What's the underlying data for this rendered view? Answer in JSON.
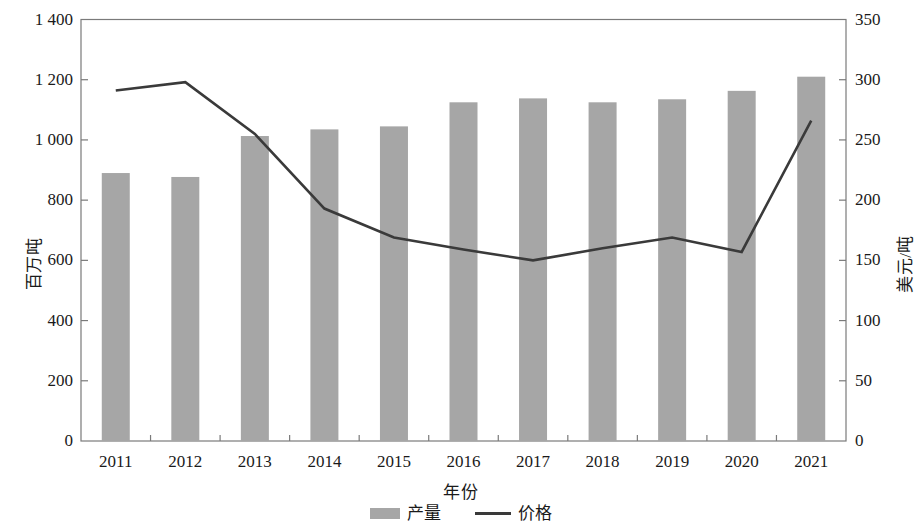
{
  "chart_data": {
    "type": "bar",
    "title": "",
    "xlabel": "年份",
    "ylabel": "百万吨",
    "ylabel_right": "美元/吨",
    "categories": [
      "2011",
      "2012",
      "2013",
      "2014",
      "2015",
      "2016",
      "2017",
      "2018",
      "2019",
      "2020",
      "2021"
    ],
    "ylim": [
      0,
      1400
    ],
    "ylim_right": [
      0,
      350
    ],
    "yticks": [
      "0",
      "200",
      "400",
      "600",
      "800",
      "1 000",
      "1 200",
      "1 400"
    ],
    "ytick_values": [
      0,
      200,
      400,
      600,
      800,
      1000,
      1200,
      1400
    ],
    "yticks_right": [
      "0",
      "50",
      "100",
      "150",
      "200",
      "250",
      "300",
      "350"
    ],
    "ytick_values_right": [
      0,
      50,
      100,
      150,
      200,
      250,
      300,
      350
    ],
    "grid": false,
    "legend_position": "bottom-center",
    "series": [
      {
        "name": "产量",
        "kind": "bar",
        "axis": "left",
        "color": "#a6a6a6",
        "values": [
          890,
          877,
          1013,
          1035,
          1045,
          1125,
          1138,
          1125,
          1135,
          1163,
          1210
        ]
      },
      {
        "name": "价格",
        "kind": "line",
        "axis": "right",
        "color": "#3a3a3a",
        "values": [
          291,
          298,
          255,
          193,
          169,
          159,
          150,
          160,
          169,
          157,
          266
        ]
      }
    ]
  },
  "legend": {
    "items": [
      {
        "label": "产量",
        "swatch": "bar-swatch"
      },
      {
        "label": "价格",
        "swatch": "line-swatch"
      }
    ]
  }
}
